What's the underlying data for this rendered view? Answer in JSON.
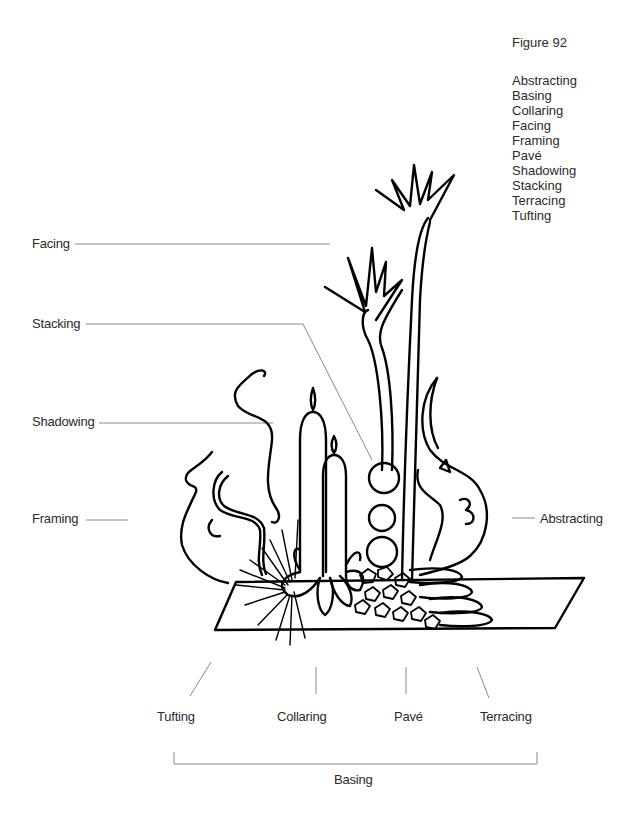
{
  "figure": {
    "title": "Figure 92",
    "legend": [
      "Abstracting",
      "Basing",
      "Collaring",
      "Facing",
      "Framing",
      "Pavé",
      "Shadowing",
      "Stacking",
      "Terracing",
      "Tufting"
    ]
  },
  "callouts": {
    "left": [
      {
        "label": "Facing"
      },
      {
        "label": "Stacking"
      },
      {
        "label": "Shadowing"
      },
      {
        "label": "Framing"
      }
    ],
    "right": [
      {
        "label": "Abstracting"
      }
    ],
    "bottom": [
      {
        "label": "Tufting"
      },
      {
        "label": "Collaring"
      },
      {
        "label": "Pavé"
      },
      {
        "label": "Terracing"
      }
    ],
    "bracket": {
      "label": "Basing"
    }
  },
  "colors": {
    "ink": "#000000",
    "leader": "#808080",
    "text": "#2b2b2b",
    "background": "#ffffff"
  }
}
